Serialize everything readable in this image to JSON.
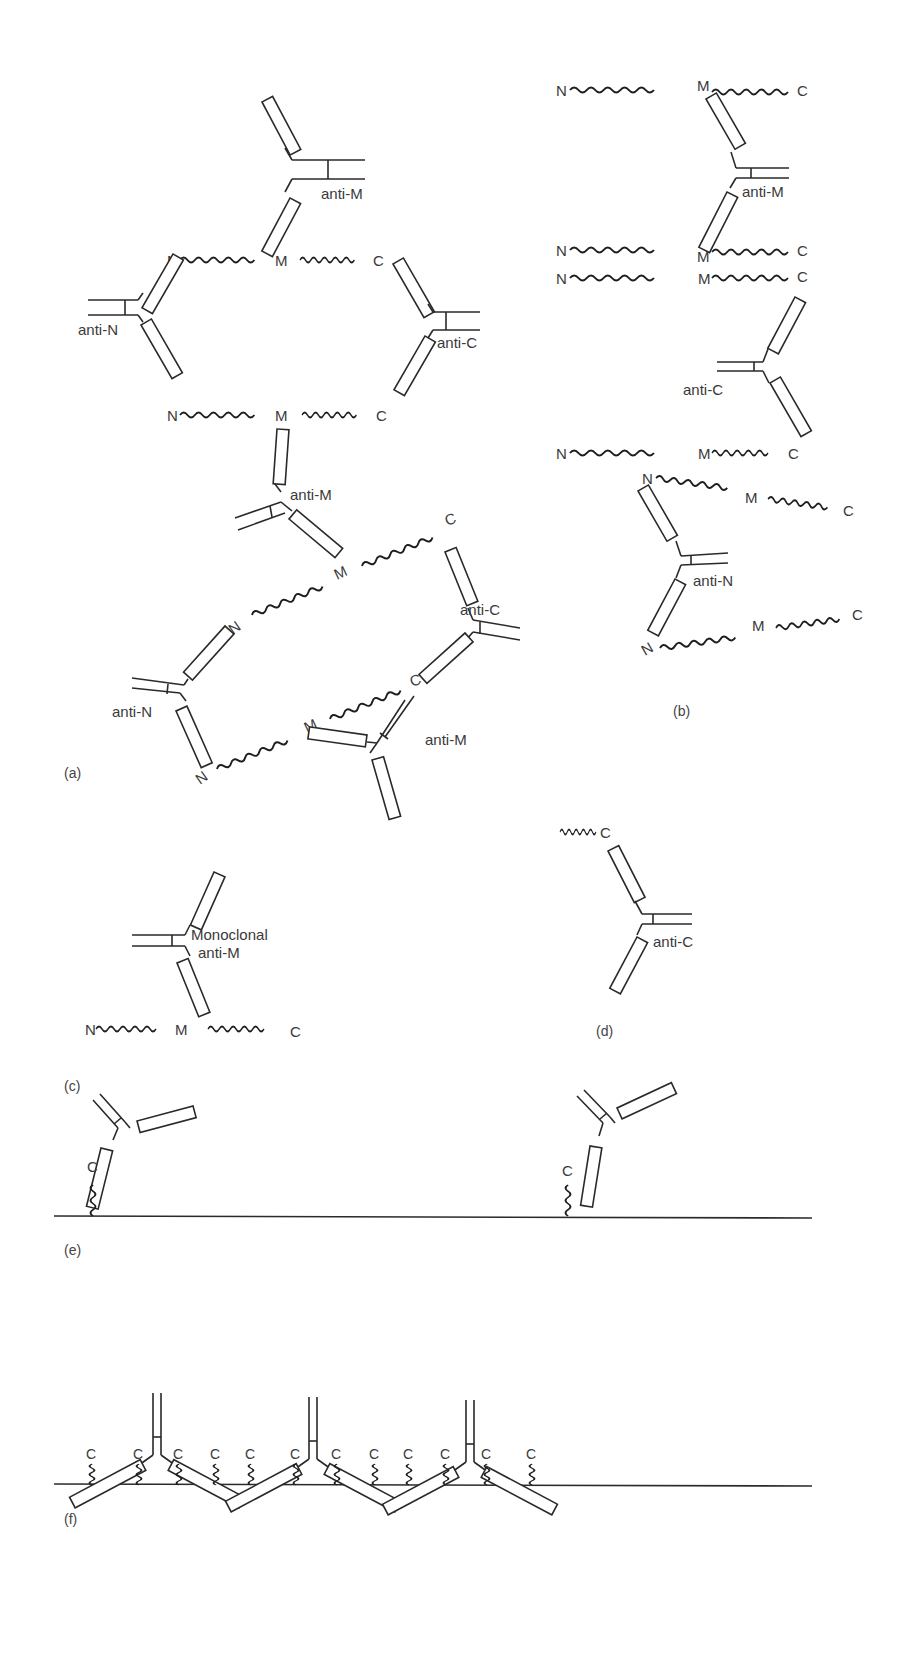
{
  "figure": {
    "panels": [
      {
        "id": "a",
        "label": "(a)"
      },
      {
        "id": "b",
        "label": "(b)"
      },
      {
        "id": "c",
        "label": "(c)"
      },
      {
        "id": "d",
        "label": "(d)"
      },
      {
        "id": "e",
        "label": "(e)"
      },
      {
        "id": "f",
        "label": "(f)"
      }
    ],
    "colors": {
      "ink": "#2a2a2a",
      "background": "#ffffff"
    }
  },
  "labels": {
    "N": "N",
    "M": "M",
    "C": "C",
    "anti_M": "anti-M",
    "anti_N": "anti-N",
    "anti_C": "anti-C",
    "monoclonal_line1": "Monoclonal",
    "monoclonal_line2": "anti-M"
  },
  "panel_a": {
    "antibodies": [
      "anti-M",
      "anti-N",
      "anti-C",
      "anti-M",
      "anti-C",
      "anti-N",
      "anti-M"
    ],
    "antigens": 4
  },
  "panel_b": {
    "antibodies": [
      "anti-M",
      "anti-C",
      "anti-N"
    ],
    "antigens": 6
  },
  "panel_c": {
    "antibodies": [
      "Monoclonal anti-M"
    ],
    "antigens": 1
  },
  "panel_d": {
    "antibodies": [
      "anti-C"
    ],
    "antigens": 1
  },
  "panel_e": {
    "antibodies": 2,
    "surface_bound_C_terminals": 2
  },
  "panel_f": {
    "antibodies": 3,
    "surface_bound_C_terminals": 12,
    "c_labels": [
      "C",
      "C",
      "C",
      "C",
      "C",
      "C",
      "C",
      "C",
      "C",
      "C",
      "C",
      "C"
    ]
  }
}
